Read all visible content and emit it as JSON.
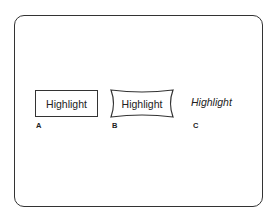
{
  "styles": [
    {
      "id": "A",
      "text": "Highlight",
      "label": "A",
      "style": "rectangular-box"
    },
    {
      "id": "B",
      "text": "Highlight",
      "label": "B",
      "style": "concave-box"
    },
    {
      "id": "C",
      "text": "Highlight",
      "label": "C",
      "style": "italic"
    }
  ]
}
